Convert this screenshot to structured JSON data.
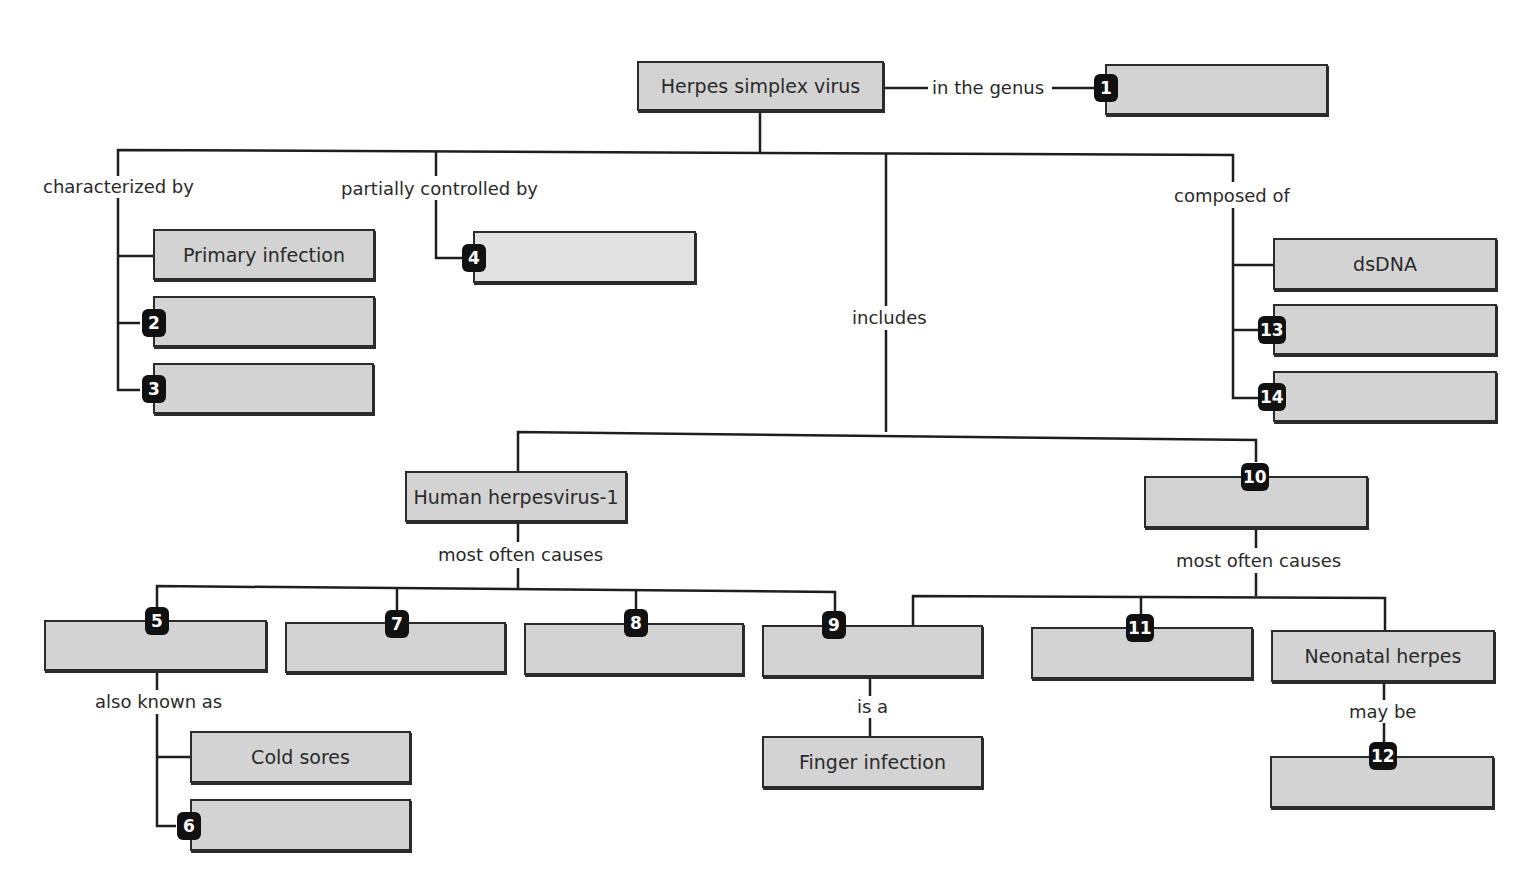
{
  "diagram": {
    "type": "concept map",
    "root": "Herpes simplex virus",
    "links": {
      "genus": "in the genus",
      "characterized": "characterized by",
      "controlled": "partially controlled by",
      "includes": "includes",
      "composed": "composed of",
      "hhv1_causes": "most often causes",
      "n10_causes": "most often causes",
      "aka": "also known as",
      "is_a": "is a",
      "may_be": "may be"
    },
    "nodes": {
      "primary_infection": "Primary infection",
      "dsdna": "dsDNA",
      "hhv1": "Human herpesvirus-1",
      "cold_sores": "Cold sores",
      "finger_infection": "Finger infection",
      "neonatal_herpes": "Neonatal herpes"
    },
    "blanks": [
      "1",
      "2",
      "3",
      "4",
      "5",
      "6",
      "7",
      "8",
      "9",
      "10",
      "11",
      "12",
      "13",
      "14"
    ]
  }
}
